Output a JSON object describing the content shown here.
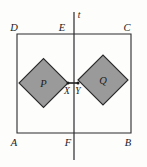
{
  "figure": {
    "canvas": {
      "width": 147,
      "height": 167
    },
    "colors": {
      "background": "#fdfdfc",
      "stroke": "#2b2b2b",
      "square_fill": "#9a9a9a",
      "square_stroke": "#2b2b2b",
      "label": "#1a1a1a"
    },
    "rectangle": {
      "name": "ABCD",
      "corners": {
        "A": {
          "x": 17,
          "y": 133
        },
        "B": {
          "x": 131,
          "y": 133
        },
        "C": {
          "x": 131,
          "y": 34
        },
        "D": {
          "x": 17,
          "y": 34
        }
      },
      "stroke_width": 1.1
    },
    "line_t": {
      "label": "t",
      "x": 74,
      "y_top": 12,
      "y_bottom": 160,
      "stroke_width": 1.2
    },
    "segment_XY": {
      "from": {
        "x": 68,
        "y": 83
      },
      "to": {
        "x": 78,
        "y": 83
      },
      "stroke_width": 1.6
    },
    "squares": [
      {
        "label": "P",
        "center": {
          "x": 43.5,
          "y": 82
        },
        "label_pos": {
          "x": 42,
          "y": 86
        },
        "points": "68,83 43.5,107.5 19,83 43.5,58.5"
      },
      {
        "label": "Q",
        "center": {
          "x": 103,
          "y": 80
        },
        "label_pos": {
          "x": 101,
          "y": 84
        },
        "points": "78,80 103,55 128,80 103,105"
      }
    ],
    "points": [
      {
        "id": "X",
        "x": 68,
        "y": 83,
        "dot": true,
        "label_x": 65,
        "label_y": 93
      },
      {
        "id": "Y",
        "x": 78,
        "y": 83,
        "dot": true,
        "label_x": 76,
        "label_y": 93
      }
    ],
    "labels": {
      "A": "A",
      "B": "B",
      "C": "C",
      "D": "D",
      "E": "E",
      "F": "F",
      "X": "X",
      "Y": "Y",
      "P": "P",
      "Q": "Q",
      "t": "t"
    },
    "label_positions": {
      "A": {
        "x": 13,
        "y": 145
      },
      "B": {
        "x": 127,
        "y": 145
      },
      "C": {
        "x": 126,
        "y": 30
      },
      "D": {
        "x": 14,
        "y": 30
      },
      "E": {
        "x": 61,
        "y": 31
      },
      "F": {
        "x": 66,
        "y": 146
      },
      "t": {
        "x": 77,
        "y": 18
      }
    },
    "label_font_size": 10,
    "inner_label_font_size": 10
  }
}
